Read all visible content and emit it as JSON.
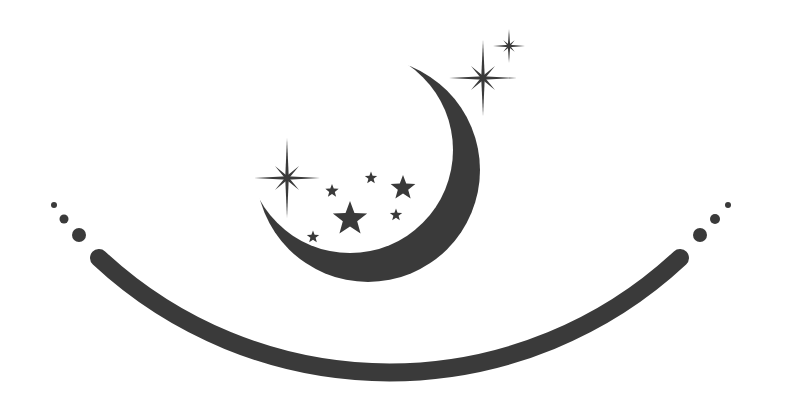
{
  "image": {
    "description": "Crescent moon with stars and sparkles above a curved smile-like arc flanked by dots",
    "ink_color": "#3a3a3a",
    "background": "#ffffff"
  },
  "crescent": {
    "outer": {
      "cx": 368,
      "cy": 170,
      "r": 112
    },
    "inner": {
      "cx": 350,
      "cy": 150,
      "r": 103
    }
  },
  "sparkles": [
    {
      "name": "sparkle-large-top",
      "cx": 483,
      "cy": 78,
      "v": 38,
      "h": 34,
      "d": 17
    },
    {
      "name": "sparkle-small-top",
      "cx": 509,
      "cy": 46,
      "v": 17,
      "h": 16,
      "d": 8
    },
    {
      "name": "sparkle-left",
      "cx": 287,
      "cy": 178,
      "v": 40,
      "h": 33,
      "d": 17
    }
  ],
  "stars": [
    {
      "cx": 350,
      "cy": 219,
      "r": 18
    },
    {
      "cx": 403,
      "cy": 188,
      "r": 13
    },
    {
      "cx": 332,
      "cy": 191,
      "r": 7
    },
    {
      "cx": 371,
      "cy": 178,
      "r": 6.5
    },
    {
      "cx": 396,
      "cy": 215,
      "r": 6.5
    },
    {
      "cx": 313,
      "cy": 237,
      "r": 6.5
    }
  ],
  "arc": {
    "x1": 99,
    "y1": 258,
    "x2": 680,
    "y2": 258,
    "r": 426,
    "stroke": 18
  },
  "dots_left": [
    {
      "cx": 54,
      "cy": 205,
      "r": 3
    },
    {
      "cx": 64,
      "cy": 219,
      "r": 4.5
    },
    {
      "cx": 79,
      "cy": 235,
      "r": 7
    }
  ],
  "dots_right": [
    {
      "cx": 728,
      "cy": 205,
      "r": 3
    },
    {
      "cx": 715,
      "cy": 219,
      "r": 5
    },
    {
      "cx": 700,
      "cy": 235,
      "r": 7
    }
  ]
}
